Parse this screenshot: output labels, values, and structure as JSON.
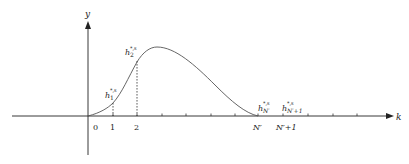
{
  "diagram": {
    "axes": {
      "x_label": "k",
      "y_label": "y",
      "origin_label": "0"
    },
    "x_ticks": [
      "0",
      "1",
      "2",
      "N′",
      "N′+1"
    ],
    "point_labels": [
      {
        "base": "h",
        "sub": "1",
        "sup": "*,s"
      },
      {
        "base": "h",
        "sub": "2",
        "sup": "*,s"
      },
      {
        "base": "h",
        "sub": "N′",
        "sup": "*,s"
      },
      {
        "base": "h",
        "sub": "N′+1",
        "sup": "*,s"
      }
    ],
    "colors": {
      "axis": "#222222",
      "curve": "#555555",
      "dashed": "#333333"
    }
  }
}
